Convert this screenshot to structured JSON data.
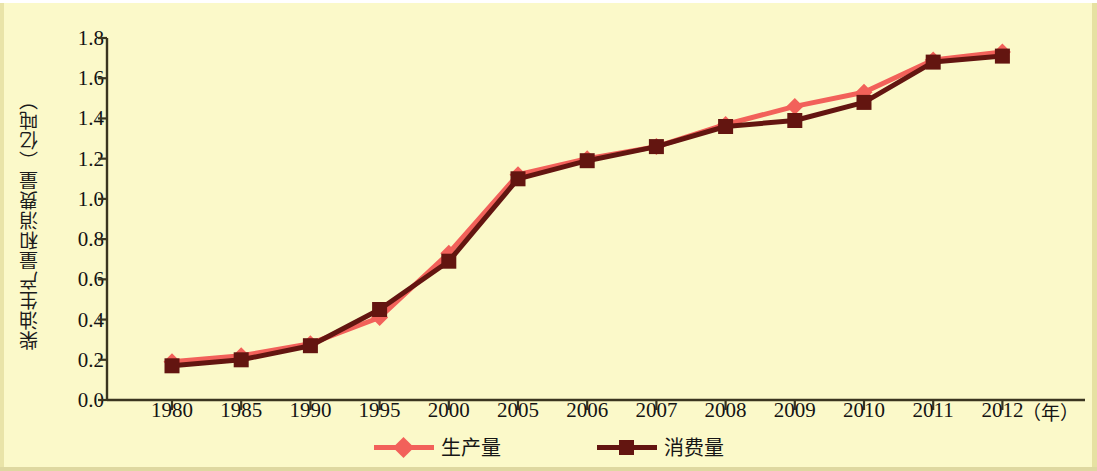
{
  "chart_data": {
    "type": "line",
    "title": "",
    "xlabel": "年",
    "ylabel": "柴油生产量和消费量（亿吨）",
    "categories": [
      "1980",
      "1985",
      "1990",
      "1995",
      "2000",
      "2005",
      "2006",
      "2007",
      "2008",
      "2009",
      "2010",
      "2011",
      "2012"
    ],
    "xtick_labels": [
      "1980",
      "1985",
      "1990",
      "1995",
      "2000",
      "2005",
      "2006",
      "2007",
      "2008",
      "2009",
      "2010",
      "2011",
      "2012"
    ],
    "ytick_labels": [
      "0.0",
      "0.2",
      "0.4",
      "0.6",
      "0.8",
      "1.0",
      "1.2",
      "1.4",
      "1.6",
      "1.8"
    ],
    "ytick_values": [
      0.0,
      0.2,
      0.4,
      0.6,
      0.8,
      1.0,
      1.2,
      1.4,
      1.6,
      1.8
    ],
    "ylim": [
      0.0,
      1.8
    ],
    "grid": false,
    "legend_position": "bottom-center",
    "series": [
      {
        "name": "生产量",
        "color": "#f2615a",
        "marker": "diamond",
        "values": [
          0.19,
          0.22,
          0.28,
          0.41,
          0.73,
          1.12,
          1.2,
          1.26,
          1.37,
          1.46,
          1.53,
          1.69,
          1.73
        ]
      },
      {
        "name": "消费量",
        "color": "#631510",
        "marker": "square",
        "values": [
          0.17,
          0.2,
          0.27,
          0.45,
          0.69,
          1.1,
          1.19,
          1.26,
          1.36,
          1.39,
          1.48,
          1.68,
          1.71
        ]
      }
    ]
  },
  "axis": {
    "unit_suffix": "（年）",
    "line_color": "#3a3520"
  },
  "legend": {
    "entries": [
      {
        "label": "生产量",
        "color": "#f2615a",
        "marker": "diamond"
      },
      {
        "label": "消费量",
        "color": "#631510",
        "marker": "square"
      }
    ]
  },
  "colors": {
    "background": "#fbf9c9",
    "production": "#f2615a",
    "consumption": "#631510",
    "axis": "#3a3520",
    "text": "#141414"
  }
}
